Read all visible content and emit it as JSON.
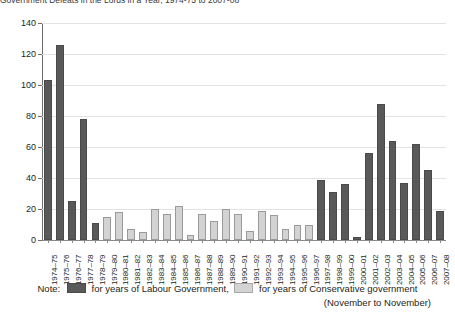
{
  "title": "Government Defeats in the Lords in a Year, 1974-75 to 2007-08",
  "chart_data": {
    "type": "bar",
    "title": "Government Defeats in the Lords in a Year, 1974-75 to 2007-08",
    "xlabel": "",
    "ylabel": "",
    "ylim": [
      0,
      140
    ],
    "yticks": [
      0,
      20,
      40,
      60,
      80,
      100,
      120,
      140
    ],
    "grid": true,
    "legend_position": "bottom",
    "categories": [
      "1974–75",
      "1975–76",
      "1976–77",
      "1977–78",
      "1978–79",
      "1979–80",
      "1980–81",
      "1981–82",
      "1982–83",
      "1983–84",
      "1984–85",
      "1985–86",
      "1986–87",
      "1987–88",
      "1988–89",
      "1989–90",
      "1990–91",
      "1991–92",
      "1992–93",
      "1993–94",
      "1994–95",
      "1995–96",
      "1996–97",
      "1997–98",
      "1998–99",
      "1999–00",
      "2000–01",
      "2001–02",
      "2002–03",
      "2003–04",
      "2004–05",
      "2005–06",
      "2006–07",
      "2007–08"
    ],
    "values": [
      103,
      126,
      25,
      78,
      11,
      15,
      18,
      7,
      5,
      20,
      17,
      22,
      3,
      17,
      12,
      20,
      17,
      6,
      19,
      16,
      7,
      10,
      10,
      39,
      31,
      36,
      2,
      56,
      88,
      64,
      37,
      62,
      45,
      19
    ],
    "series": [
      {
        "name": "for years of Labour Government",
        "color": "#595959",
        "indices": [
          0,
          1,
          2,
          3,
          4,
          23,
          24,
          25,
          26,
          27,
          28,
          29,
          30,
          31,
          32,
          33
        ]
      },
      {
        "name": "for years of Conservative government",
        "color": "#d3d3d3",
        "indices": [
          5,
          6,
          7,
          8,
          9,
          10,
          11,
          12,
          13,
          14,
          15,
          16,
          17,
          18,
          19,
          20,
          21,
          22
        ]
      }
    ],
    "bar_party": [
      "labour",
      "labour",
      "labour",
      "labour",
      "labour",
      "conservative",
      "conservative",
      "conservative",
      "conservative",
      "conservative",
      "conservative",
      "conservative",
      "conservative",
      "conservative",
      "conservative",
      "conservative",
      "conservative",
      "conservative",
      "conservative",
      "conservative",
      "conservative",
      "conservative",
      "conservative",
      "labour",
      "labour",
      "labour",
      "labour",
      "labour",
      "labour",
      "labour",
      "labour",
      "labour",
      "labour",
      "labour"
    ]
  },
  "legend": {
    "note_label": "Note:",
    "labour_label": "for years of Labour Government,",
    "conservative_label": "for years of Conservative government"
  },
  "caption": "(November to November)",
  "colors": {
    "labour": "#595959",
    "conservative": "#d3d3d3",
    "gridline": "#e3e3e3",
    "axis": "#6d6d6d"
  }
}
